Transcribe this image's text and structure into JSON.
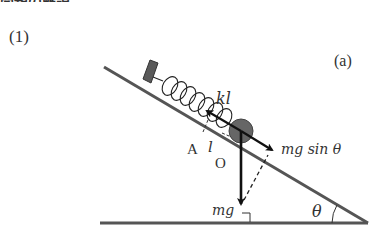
{
  "heading_fragment": "問題の解説",
  "part_label": "(1)",
  "figure_label": "(a)",
  "diagram": {
    "labels": {
      "spring_force": "kl",
      "point_A": "A",
      "displacement": "l",
      "point_O": "O",
      "gravity_component": "mg sin θ",
      "gravity": "mg",
      "angle": "θ"
    },
    "colors": {
      "incline": "#555555",
      "wall_block": "#555555",
      "mass": "#666666",
      "arrows": "#111111"
    }
  }
}
